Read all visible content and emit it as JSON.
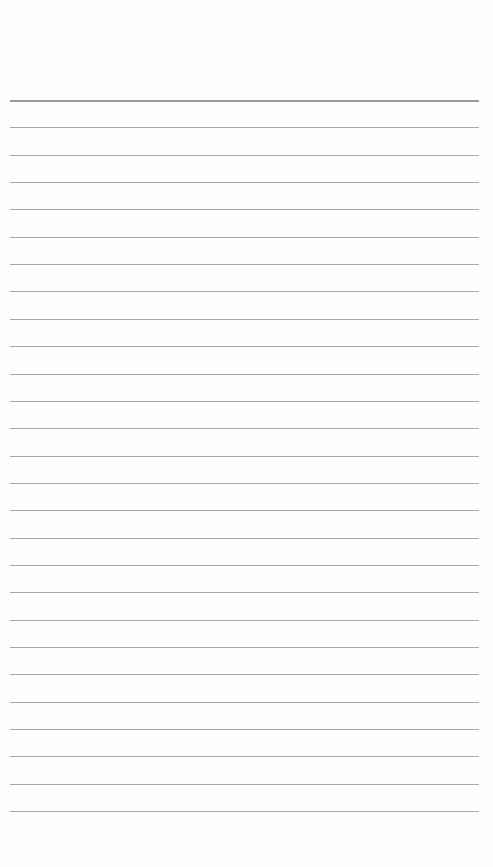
{
  "page": {
    "type": "lined-paper",
    "line_count": 27,
    "first_line_y": 100,
    "line_spacing": 27.35,
    "line_color": "#a9a9a9",
    "background_color": "#fefefe"
  }
}
